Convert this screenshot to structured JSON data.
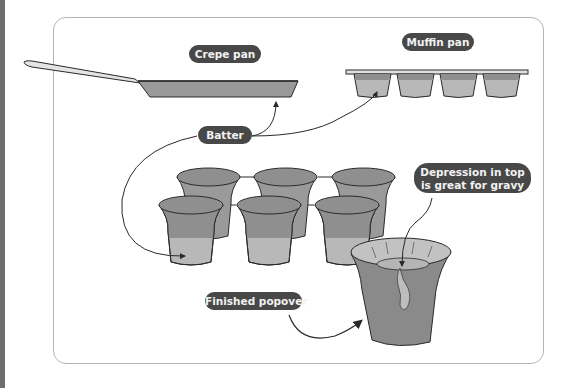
{
  "labels": {
    "crepe_pan": "Crepe pan",
    "muffin_pan": "Muffin pan",
    "batter": "Batter",
    "depression_line1": "Depression in top",
    "depression_line2": "is great for gravy",
    "finished_popover": "Finished popover"
  },
  "colors": {
    "label_bg": "#484848",
    "label_text": "#f2f2f2",
    "batter_dark": "#8f8f8f",
    "batter_light": "#b8b8b8",
    "outline": "#2a2a2a",
    "panel_border": "#b5b5b5",
    "edge_strip": "#6e6e6e"
  },
  "diagram": {
    "items": [
      "crepe pan",
      "muffin pan (4 cups)",
      "popover pan (6 cups)",
      "finished popover"
    ],
    "arrows": [
      {
        "from": "Batter",
        "to": "Crepe pan"
      },
      {
        "from": "Batter",
        "to": "Muffin pan"
      },
      {
        "from": "Batter",
        "to": "Popover pan"
      },
      {
        "from": "Depression in top is great for gravy",
        "to": "Finished popover top"
      },
      {
        "from": "Finished popover",
        "to": "Finished popover"
      }
    ]
  }
}
